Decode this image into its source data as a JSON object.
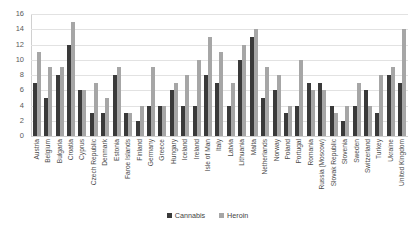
{
  "chart_data": {
    "type": "bar",
    "title": "",
    "xlabel": "",
    "ylabel": "",
    "ylim": [
      0,
      16
    ],
    "yticks": [
      0,
      2,
      4,
      6,
      8,
      10,
      12,
      14,
      16
    ],
    "grid": true,
    "legend_position": "bottom",
    "colors": {
      "cannabis": "#3a3a3a",
      "heroin": "#a6a6a6",
      "gridline": "#e2e2e2"
    },
    "categories": [
      "Austria",
      "Belgium",
      "Bulgaria",
      "Croatia",
      "Cyprus",
      "Czech Republic",
      "Denmark",
      "Estonia",
      "Faroe Islands",
      "Finland",
      "Germany",
      "Greece",
      "Hungary",
      "Iceland",
      "Ireland",
      "Isle of Man",
      "Italy",
      "Latvia",
      "Lithuania",
      "Malta",
      "Netherlands",
      "Norway",
      "Poland",
      "Portugal",
      "Romania",
      "Russia (Moscow)",
      "Slovak Republic",
      "Slovenia",
      "Sweden",
      "Switzerland",
      "Turkey",
      "Ukraine",
      "United Kingdom"
    ],
    "series": [
      {
        "name": "Cannabis",
        "color": "#3a3a3a",
        "values": [
          7,
          5,
          8,
          12,
          6,
          3,
          3,
          8,
          3,
          2,
          4,
          4,
          6,
          4,
          4,
          8,
          7,
          4,
          10,
          13,
          5,
          6,
          3,
          4,
          7,
          7,
          4,
          2,
          4,
          6,
          3,
          8,
          7
        ]
      },
      {
        "name": "Heroin",
        "color": "#a6a6a6",
        "values": [
          11,
          9,
          9,
          15,
          6,
          7,
          5,
          9,
          3,
          4,
          9,
          4,
          7,
          8,
          10,
          13,
          11,
          7,
          12,
          14,
          9,
          8,
          4,
          10,
          6,
          6,
          3,
          4,
          7,
          4,
          8,
          9,
          14
        ]
      }
    ]
  },
  "legend": {
    "items": [
      {
        "label": "Cannabis"
      },
      {
        "label": "Heroin"
      }
    ]
  }
}
